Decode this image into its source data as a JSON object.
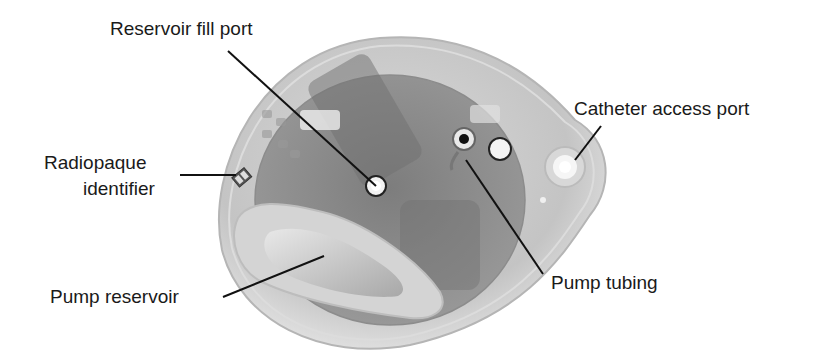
{
  "diagram": {
    "labels": {
      "reservoir_fill_port": "Reservoir fill port",
      "radiopaque_identifier_line1": "Radiopaque",
      "radiopaque_identifier_line2": "identifier",
      "pump_reservoir": "Pump reservoir",
      "catheter_access_port": "Catheter access port",
      "pump_tubing": "Pump tubing"
    },
    "identifier_mark": "U NCB",
    "colors": {
      "background": "#ffffff",
      "text": "#1a1a1a",
      "leader_line": "#111111",
      "device_shell": "#c8c8c8",
      "device_core": "#8a8a8a"
    }
  }
}
